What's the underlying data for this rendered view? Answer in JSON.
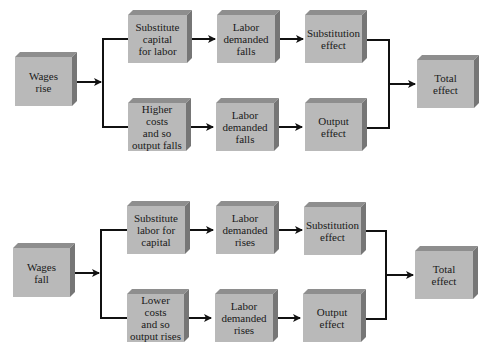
{
  "diagrams": [
    {
      "name": "wages-rise",
      "start": "Wages\nrise",
      "upper_path": [
        "Substitute\ncapital\nfor labor",
        "Labor\ndemanded\nfalls",
        "Substitution\neffect"
      ],
      "lower_path": [
        "Higher costs\nand so\noutput falls",
        "Labor\ndemanded\nfalls",
        "Output\neffect"
      ],
      "end": "Total\neffect"
    },
    {
      "name": "wages-fall",
      "start": "Wages\nfall",
      "upper_path": [
        "Substitute\nlabor for\ncapital",
        "Labor\ndemanded\nrises",
        "Substitution\neffect"
      ],
      "lower_path": [
        "Lower costs\nand so\noutput rises",
        "Labor\ndemanded\nrises",
        "Output\neffect"
      ],
      "end": "Total\neffect"
    }
  ],
  "colors": {
    "box_front": "#b9b9b9",
    "box_top": "#8e8e8e",
    "box_side": "#767676",
    "line": "#111111"
  }
}
